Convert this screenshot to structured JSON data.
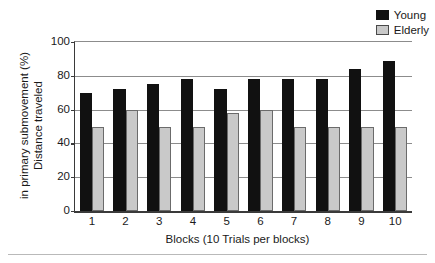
{
  "chart_data": {
    "type": "bar",
    "title": "",
    "subtitle": "",
    "xlabel": "Blocks (10 Trials per blocks)",
    "ylabel_lines": [
      "Distance traveled",
      "in primary submovement (%)"
    ],
    "ylabel": "Distance traveled in primary submovement (%)",
    "categories": [
      "1",
      "2",
      "3",
      "4",
      "5",
      "6",
      "7",
      "8",
      "9",
      "10"
    ],
    "series": [
      {
        "name": "Young",
        "color": "#111111",
        "values": [
          70,
          72,
          75,
          78,
          72,
          78,
          78,
          78,
          84,
          89
        ]
      },
      {
        "name": "Elderly",
        "color": "#c9c9c9",
        "values": [
          50,
          60,
          50,
          50,
          58,
          60,
          50,
          50,
          50,
          50
        ]
      }
    ],
    "ylim": [
      0,
      100
    ],
    "yticks": [
      0,
      20,
      40,
      60,
      80,
      100
    ],
    "ytick_labels": [
      "0",
      "20",
      "40",
      "60",
      "80",
      "100"
    ],
    "grid": "horizontal",
    "legend_position": "top-right"
  },
  "legend": {
    "entries": [
      {
        "label": "Young",
        "swatch": "young"
      },
      {
        "label": "Elderly",
        "swatch": "elderly"
      }
    ]
  }
}
